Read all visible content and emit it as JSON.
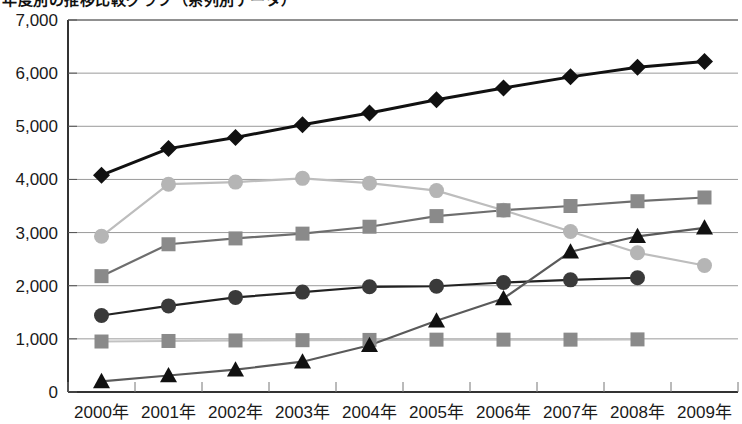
{
  "title": "年度別の推移比較グラフ（系列別データ）",
  "chart_data": {
    "type": "line",
    "title": "年度別の推移比較グラフ（系列別データ）",
    "xlabel": "",
    "ylabel": "",
    "ylim": [
      0,
      7000
    ],
    "yticks": [
      0,
      1000,
      2000,
      3000,
      4000,
      5000,
      6000,
      7000
    ],
    "ytick_labels": [
      "0",
      "1,000",
      "2,000",
      "3,000",
      "4,000",
      "5,000",
      "6,000",
      "7,000"
    ],
    "grid": true,
    "legend_position": "none",
    "categories": [
      "2000年",
      "2001年",
      "2002年",
      "2003年",
      "2004年",
      "2005年",
      "2006年",
      "2007年",
      "2008年",
      "2009年"
    ],
    "series": [
      {
        "name": "series-1-diamond",
        "marker": "diamond",
        "color": "#111111",
        "line_color": "#111111",
        "values": [
          4080,
          4580,
          4790,
          5030,
          5250,
          5500,
          5720,
          5930,
          6110,
          6220
        ]
      },
      {
        "name": "series-2-light-circle",
        "marker": "circle",
        "color": "#b5b5b5",
        "line_color": "#bdbdbd",
        "values": [
          2930,
          3910,
          3950,
          4020,
          3930,
          3790,
          3420,
          3020,
          2620,
          2380
        ]
      },
      {
        "name": "series-3-gray-square",
        "marker": "square",
        "color": "#8a8a8a",
        "line_color": "#6e6e6e",
        "values": [
          2180,
          2780,
          2890,
          2980,
          3110,
          3310,
          3420,
          3500,
          3590,
          3660
        ]
      },
      {
        "name": "series-4-dark-circle",
        "marker": "circle",
        "color": "#3a3a3a",
        "line_color": "#222222",
        "values": [
          1440,
          1620,
          1780,
          1880,
          1980,
          1990,
          2060,
          2110,
          2150,
          null
        ]
      },
      {
        "name": "series-5-flat-square",
        "marker": "square",
        "color": "#8a8a8a",
        "line_color": "#c2c2c2",
        "values": [
          950,
          960,
          970,
          975,
          980,
          985,
          985,
          985,
          990,
          null
        ]
      },
      {
        "name": "series-6-triangle",
        "marker": "triangle",
        "color": "#111111",
        "line_color": "#5a5a5a",
        "values": [
          200,
          310,
          420,
          570,
          880,
          1340,
          1760,
          2640,
          2930,
          3090
        ]
      }
    ]
  }
}
